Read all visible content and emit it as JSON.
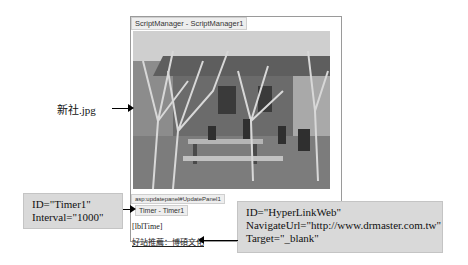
{
  "designer": {
    "script_manager_tag": "ScriptManager - ScriptManager1",
    "update_panel_tag": "asp:updatepanel#UpdatePanel1",
    "timer_tag": "Timer - Timer1",
    "label_text": "[lblTime]",
    "link_text": "好站推薦：博碩文化",
    "image_name": "新社.jpg"
  },
  "callouts": {
    "image": {
      "label": "新社.jpg"
    },
    "timer": {
      "line1": "ID=\"Timer1\"",
      "line2": "Interval=\"1000\""
    },
    "hyperlink": {
      "line1": "ID=\"HyperLinkWeb\"",
      "line2": "NavigateUrl=\"http://www.drmaster.com.tw\"",
      "line3": "Target=\"_blank\""
    }
  },
  "colors": {
    "callout_bg": "#d9d9d9",
    "frame_border": "#9a9a9a",
    "tag_bg": "#eeeeee"
  }
}
